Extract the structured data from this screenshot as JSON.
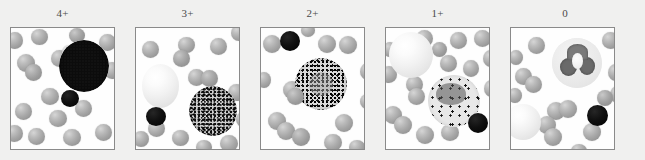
{
  "figure": {
    "caption_visible": false,
    "background_color": "#f0f0ef",
    "frame_border_color": "#8a8a8a",
    "frame_background_color": "#fefefe",
    "label_color": "#4a4a4a",
    "panel_count": 5
  },
  "panels": [
    {
      "label": "4+",
      "stain_intensity": "very strong",
      "description": "Large leukocyte filled with confluent dense black granular staining; small black lymphocyte below it; surrounding gray red blood cells",
      "cells": {
        "stained_leukocytes": 1,
        "dark_lymphocytes": 1,
        "pale_cells": 0,
        "red_blood_cells": 17
      }
    },
    {
      "label": "3+",
      "stain_intensity": "strong",
      "description": "Leukocyte with dense but discrete dark granules at lower right; large pale unstained cell at left; small black lymphocyte at lower left",
      "cells": {
        "stained_leukocytes": 1,
        "dark_lymphocytes": 1,
        "pale_cells": 1,
        "red_blood_cells": 14
      }
    },
    {
      "label": "2+",
      "stain_intensity": "moderate",
      "description": "Centrally placed leukocyte with moderate granular staining and a faintly visible nucleus; small black lymphocyte at upper left",
      "cells": {
        "stained_leukocytes": 1,
        "dark_lymphocytes": 1,
        "pale_cells": 0,
        "red_blood_cells": 14
      }
    },
    {
      "label": "1+",
      "stain_intensity": "weak",
      "description": "Leukocyte with only scattered sparse dark granules over a pale cytoplasm and visible lobed nucleus; large pale cell at upper left; black lymphocyte at lower right",
      "cells": {
        "stained_leukocytes": 1,
        "dark_lymphocytes": 1,
        "pale_cells": 1,
        "red_blood_cells": 16
      }
    },
    {
      "label": "0",
      "stain_intensity": "none",
      "description": "Unstained segmented neutrophil showing only its gray lobed nucleus with no granule staining; pale cell at lower left; black lymphocyte at lower right",
      "cells": {
        "stained_leukocytes": 1,
        "dark_lymphocytes": 1,
        "pale_cells": 1,
        "red_blood_cells": 15
      }
    }
  ]
}
